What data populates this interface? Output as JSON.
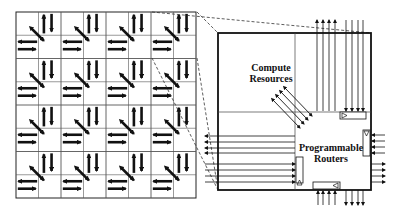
{
  "diagram": {
    "grid": {
      "rows": 4,
      "cols": 4,
      "description": "4x4 array of tiles; each tile has compute block, router block and arrows"
    },
    "detail": {
      "compute_label_line1": "Compute",
      "compute_label_line2": "Resources",
      "router_label_line1": "Programmable",
      "router_label_line2": "Routers"
    },
    "colors": {
      "line": "#111111",
      "grid_line": "#555555",
      "background": "#ffffff"
    }
  }
}
